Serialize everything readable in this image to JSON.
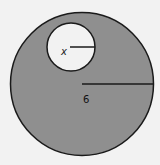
{
  "diagram": {
    "outer_circle": {
      "cx": 82,
      "cy": 84,
      "r": 72,
      "fill": "#8f8f8f",
      "radius_label": "6"
    },
    "inner_circle": {
      "cx": 71,
      "cy": 47,
      "r": 24,
      "fill": "#f2f2f2",
      "radius_label": "x"
    },
    "background": "#f2f2f2"
  }
}
